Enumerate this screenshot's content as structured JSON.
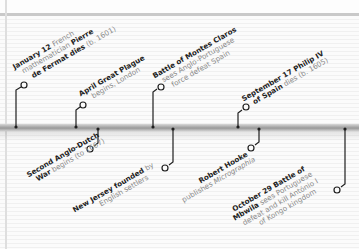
{
  "colors": {
    "background": "#fbfbfb",
    "rule_lines": "#e9e9e9",
    "timeline_bar": "#a6a6a6",
    "connector": "#1f1f1f",
    "bold_text": "#1f1f1f",
    "light_text": "#8a8a8a"
  },
  "events_above": [
    {
      "date": "January 12",
      "lines": [
        {
          "bold": "January 12",
          "light": " French"
        },
        {
          "light": "mathematician ",
          "bold": "Pierre"
        },
        {
          "bold": "de Fermat dies",
          "light": " (b. 1601)"
        }
      ]
    },
    {
      "date": "April",
      "lines": [
        {
          "bold": "April Great Plague"
        },
        {
          "light": "begins, London"
        }
      ]
    },
    {
      "date": "",
      "lines": [
        {
          "bold": "Battle of Montes Claros"
        },
        {
          "light": "sees Anglo-Portuguese"
        },
        {
          "light": "force defeat Spain"
        }
      ]
    },
    {
      "date": "September 17",
      "lines": [
        {
          "bold": "September 17 Philip IV"
        },
        {
          "bold": "of Spain",
          "light": " dies (b. 1605)"
        }
      ]
    }
  ],
  "events_below": [
    {
      "lines": [
        {
          "bold": "Second Anglo-Dutch"
        },
        {
          "bold": "War",
          "light": " begins (to 1667)"
        }
      ]
    },
    {
      "lines": [
        {
          "bold": "New Jersey founded",
          "light": " by"
        },
        {
          "light": "English settlers"
        }
      ]
    },
    {
      "lines": [
        {
          "bold": "Robert Hooke"
        },
        {
          "light": "publishes ",
          "italic": "Micrographia"
        }
      ]
    },
    {
      "date": "October 29",
      "lines": [
        {
          "bold": "October 29 Battle of"
        },
        {
          "bold": "Mbwila",
          "light": " sees Portuguese"
        },
        {
          "light": "defeat and kill António I"
        },
        {
          "light": "of Kongo kingdom"
        }
      ]
    }
  ],
  "text": {
    "e1_a_b": "January 12",
    "e1_a_l": " French",
    "e1_b_l": "mathematician ",
    "e1_b_b": "Pierre",
    "e1_c_b": "de Fermat dies",
    "e1_c_l": " (b. 1601)",
    "e2_a_b": "April Great Plague",
    "e2_b_l": "begins, London",
    "e3_a_b": "Battle of Montes Claros",
    "e3_b_l": "sees Anglo-Portuguese",
    "e3_c_l": "force defeat Spain",
    "e4_a_b": "September 17 Philip IV",
    "e4_b_b": "of Spain",
    "e4_b_l": " dies (b. 1605)",
    "e5_a_b": "Second Anglo-Dutch",
    "e5_b_b": "War",
    "e5_b_l": " begins (to 1667)",
    "e6_a_b": "New Jersey founded",
    "e6_a_l": " by",
    "e6_b_l": "English settlers",
    "e7_a_b": "Robert Hooke",
    "e7_b_l": "publishes ",
    "e7_b_i": "Micrographia",
    "e8_a_b": "October 29 Battle of",
    "e8_b_b": "Mbwila",
    "e8_b_l": " sees Portuguese",
    "e8_c_l": "defeat and kill António I",
    "e8_d_l": "of Kongo kingdom"
  }
}
